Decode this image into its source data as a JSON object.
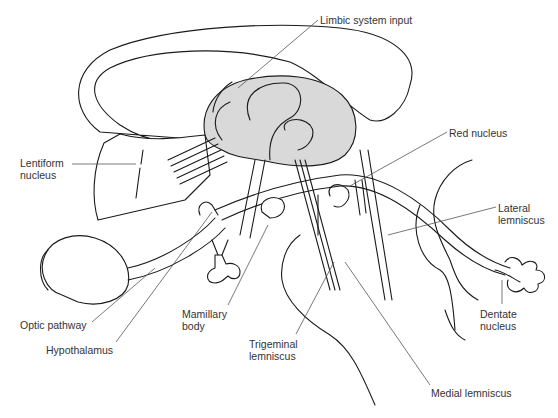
{
  "diagram": {
    "type": "anatomical line drawing",
    "labels": [
      {
        "id": "limbic",
        "text": "Limbic system input",
        "x": 320,
        "y": 14
      },
      {
        "id": "red",
        "text": "Red nucleus",
        "x": 449,
        "y": 127
      },
      {
        "id": "lentiform",
        "text": "Lentiform\nnucleus",
        "x": 20,
        "y": 157
      },
      {
        "id": "lateral",
        "text": "Lateral\nlemniscus",
        "x": 498,
        "y": 202
      },
      {
        "id": "mamillary",
        "text": "Mamillary\nbody",
        "x": 182,
        "y": 308
      },
      {
        "id": "dentate",
        "text": "Dentate\nnucleus",
        "x": 480,
        "y": 308
      },
      {
        "id": "optic",
        "text": "Optic pathway",
        "x": 20,
        "y": 319
      },
      {
        "id": "hypothalamus",
        "text": "Hypothalamus",
        "x": 46,
        "y": 344
      },
      {
        "id": "trigeminal",
        "text": "Trigeminal\nlemniscus",
        "x": 249,
        "y": 338
      },
      {
        "id": "medial",
        "text": "Medial lemniscus",
        "x": 431,
        "y": 387
      }
    ]
  }
}
